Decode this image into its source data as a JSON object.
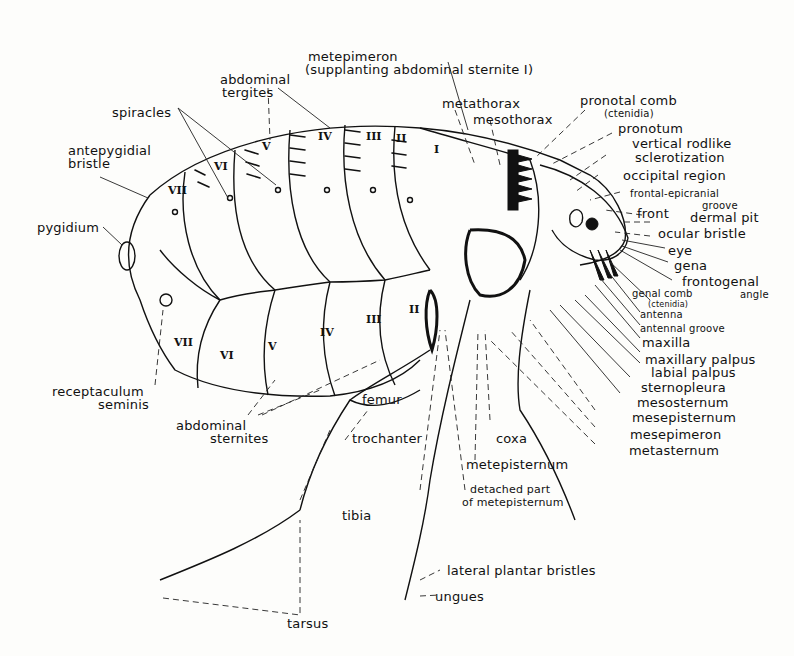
{
  "diagram": {
    "labels": {
      "metepimeron": "metepimeron",
      "metepimeron_note": "(supplanting abdominal sternite I)",
      "abdominal_tergites": [
        "abdominal",
        "tergites"
      ],
      "spiracles": "spiracles",
      "antepygidial_bristle": [
        "antepygidial",
        "bristle"
      ],
      "pygidium": "pygidium",
      "receptaculum_seminis": [
        "receptaculum",
        "seminis"
      ],
      "abdominal_sternites": [
        "abdominal",
        "sternites"
      ],
      "metathorax": "metathorax",
      "mesothorax": "mesothorax",
      "pronotal_comb": "pronotal comb",
      "pronotal_comb_note": "(ctenidia)",
      "pronotum": "pronotum",
      "vertical_rodlike": "vertical rodlike",
      "sclerotization": "sclerotization",
      "occipital_region": "occipital region",
      "frontal_epicranial": "frontal-epicranial",
      "groove": "groove",
      "front": "front",
      "dermal_pit": "dermal pit",
      "ocular_bristle": "ocular bristle",
      "eye": "eye",
      "gena": "gena",
      "frontogenal": "frontogenal",
      "angle": "angle",
      "genal_comb": "genal comb",
      "genal_comb_note": "(ctenidia)",
      "antenna": "antenna",
      "antennal_groove": "antennal groove",
      "maxilla": "maxilla",
      "maxillary_palpus": "maxillary palpus",
      "labial_palpus": "labial palpus",
      "sternopleura": "sternopleura",
      "mesosternum": "mesosternum",
      "mesepisternum": "mesepisternum",
      "mesepimeron": "mesepimeron",
      "metasternum": "metasternum",
      "femur": "femur",
      "trochanter": "trochanter",
      "coxa": "coxa",
      "metepisternum": "metepisternum",
      "detached_part": "detached part",
      "of_metepisternum": "of metepisternum",
      "tibia": "tibia",
      "lateral_plantar_bristles": "lateral plantar bristles",
      "ungues": "ungues",
      "tarsus": "tarsus"
    },
    "tergite_numerals": [
      "VII",
      "VI",
      "V",
      "IV",
      "III",
      "II",
      "I"
    ],
    "sternite_numerals": [
      "VII",
      "VI",
      "V",
      "IV",
      "III",
      "II"
    ]
  }
}
